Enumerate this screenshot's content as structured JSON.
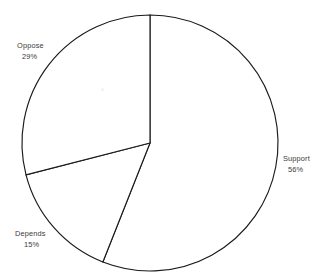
{
  "figure": {
    "background_color": "#ffffff",
    "outline_color": "#1a1a1a",
    "label_color": "#3a3a3a",
    "speck_name": "scan-artifact-speck"
  },
  "chart_data": {
    "type": "pie",
    "title": "",
    "subtitle": "",
    "xlabel": "",
    "ylabel": "",
    "legend_position": "none",
    "grid": false,
    "labels_outside": true,
    "start_angle_deg": 0,
    "direction": "clockwise",
    "center": {
      "x": 150,
      "y": 143
    },
    "radius": 128,
    "categories": [
      "Support",
      "Depends",
      "Oppose"
    ],
    "values": [
      56,
      15,
      29
    ],
    "unit": "%",
    "slices": [
      {
        "name": "Support",
        "value": 56,
        "value_label": "56%",
        "start_deg": 0,
        "end_deg": 201.6,
        "fill": "#ffffff",
        "stroke": "#1a1a1a",
        "label_name": "Support",
        "label_value": "56%"
      },
      {
        "name": "Depends",
        "value": 15,
        "value_label": "15%",
        "start_deg": 201.6,
        "end_deg": 255.6,
        "fill": "#ffffff",
        "stroke": "#1a1a1a",
        "label_name": "Depends",
        "label_value": "15%"
      },
      {
        "name": "Oppose",
        "value": 29,
        "value_label": "29%",
        "start_deg": 255.6,
        "end_deg": 360,
        "fill": "#ffffff",
        "stroke": "#1a1a1a",
        "label_name": "Oppose",
        "label_value": "29%"
      }
    ]
  }
}
